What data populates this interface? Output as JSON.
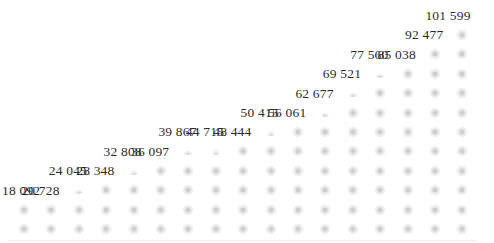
{
  "chart_data": {
    "type": "bar",
    "style": "pictograph-dot-stack",
    "title": "",
    "xlabel": "",
    "ylabel": "",
    "grid": false,
    "legend": null,
    "categories": [
      "1",
      "2",
      "3",
      "4",
      "5",
      "6",
      "7",
      "8",
      "9",
      "10",
      "11",
      "12",
      "13",
      "14",
      "15",
      "16",
      "17"
    ],
    "values": [
      18092,
      20728,
      24045,
      28348,
      32808,
      36097,
      39867,
      44715,
      48444,
      50415,
      56061,
      62677,
      69521,
      77560,
      85038,
      92477,
      101599
    ],
    "labels": [
      "18 092",
      "20 728",
      "24 045",
      "28 348",
      "32 808",
      "36 097",
      "39 867",
      "44 715",
      "48 444",
      "50 415",
      "56 061",
      "62 677",
      "69 521",
      "77 560",
      "85 038",
      "92 477",
      "101 599"
    ],
    "dot_unit_value": 9236,
    "ylim": [
      0,
      101599
    ]
  },
  "colors": {
    "dot": "#d0d0d0",
    "label": "#2b2b2b",
    "background": "#ffffff"
  }
}
